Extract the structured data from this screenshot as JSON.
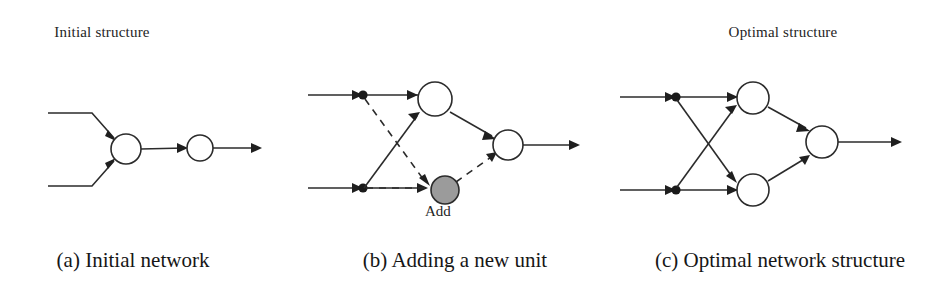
{
  "figure": {
    "background_color": "#ffffff",
    "ink_color": "#2b2b2b",
    "new_unit_fill_color": "#9b9b9b"
  },
  "panels": [
    {
      "id": "a",
      "title": "Initial structure",
      "caption": "(a) Initial network",
      "diagram": {
        "type": "neural-network",
        "nodes": [
          {
            "name": "hidden-node",
            "cx": 126,
            "cy": 149,
            "r": 15,
            "style": "open"
          },
          {
            "name": "output-node",
            "cx": 200,
            "cy": 148,
            "r": 13,
            "style": "open"
          }
        ],
        "inputs": 2,
        "edges": [
          {
            "from": "input-1",
            "to": "hidden-node",
            "style": "solid"
          },
          {
            "from": "input-2",
            "to": "hidden-node",
            "style": "solid"
          },
          {
            "from": "hidden-node",
            "to": "output-node",
            "style": "solid"
          },
          {
            "from": "output-node",
            "to": "output-arrow",
            "style": "solid"
          }
        ]
      }
    },
    {
      "id": "b",
      "title": "",
      "caption": "(b) Adding a new unit",
      "node_label": "Add",
      "diagram": {
        "type": "neural-network",
        "nodes": [
          {
            "name": "hidden-node",
            "cx": 135,
            "cy": 99,
            "r": 17,
            "style": "open"
          },
          {
            "name": "new-unit-node",
            "cx": 145,
            "cy": 190,
            "r": 14,
            "style": "filled"
          },
          {
            "name": "output-node",
            "cx": 208,
            "cy": 145,
            "r": 15,
            "style": "open"
          }
        ],
        "inputs": 2,
        "edges": [
          {
            "from": "input-1",
            "to": "hidden-node",
            "style": "solid"
          },
          {
            "from": "input-2",
            "to": "hidden-node",
            "style": "solid"
          },
          {
            "from": "input-1-branch",
            "to": "new-unit-node",
            "style": "dashed"
          },
          {
            "from": "input-2-branch",
            "to": "new-unit-node",
            "style": "dashed"
          },
          {
            "from": "hidden-node",
            "to": "output-node",
            "style": "solid"
          },
          {
            "from": "new-unit-node",
            "to": "output-node",
            "style": "dashed"
          },
          {
            "from": "output-node",
            "to": "output-arrow",
            "style": "solid"
          }
        ]
      }
    },
    {
      "id": "c",
      "title": "Optimal structure",
      "caption": "(c) Optimal network structure",
      "diagram": {
        "type": "neural-network",
        "nodes": [
          {
            "name": "hidden-node-top",
            "cx": 143,
            "cy": 98,
            "r": 16,
            "style": "open"
          },
          {
            "name": "hidden-node-bottom",
            "cx": 143,
            "cy": 190,
            "r": 16,
            "style": "open"
          },
          {
            "name": "output-node",
            "cx": 212,
            "cy": 142,
            "r": 16,
            "style": "open"
          }
        ],
        "inputs": 2,
        "edges": [
          {
            "from": "input-1",
            "to": "hidden-node-top",
            "style": "solid"
          },
          {
            "from": "input-1",
            "to": "hidden-node-bottom",
            "style": "solid"
          },
          {
            "from": "input-2",
            "to": "hidden-node-top",
            "style": "solid"
          },
          {
            "from": "input-2",
            "to": "hidden-node-bottom",
            "style": "solid"
          },
          {
            "from": "hidden-node-top",
            "to": "output-node",
            "style": "solid"
          },
          {
            "from": "hidden-node-bottom",
            "to": "output-node",
            "style": "solid"
          },
          {
            "from": "output-node",
            "to": "output-arrow",
            "style": "solid"
          }
        ]
      }
    }
  ]
}
